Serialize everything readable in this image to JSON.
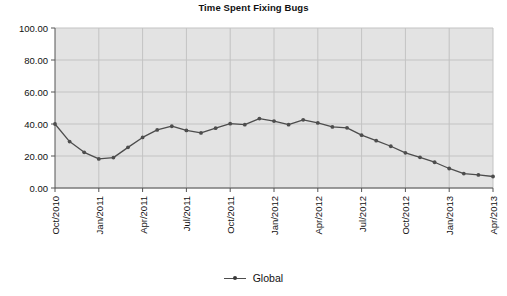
{
  "chart_data": {
    "type": "line",
    "title": "Time Spent Fixing Bugs",
    "xlabel": "",
    "ylabel": "",
    "ylim": [
      0,
      100
    ],
    "ytick_labels": [
      "0.00",
      "20.00",
      "40.00",
      "60.00",
      "80.00",
      "100.00"
    ],
    "ytick_values": [
      0,
      20,
      40,
      60,
      80,
      100
    ],
    "xtick_labels": [
      "Oct/2010",
      "Jan/2011",
      "Apr/2011",
      "Jul/2011",
      "Oct/2011",
      "Jan/2012",
      "Apr/2012",
      "Jul/2012",
      "Oct/2012",
      "Jan/2013",
      "Apr/2013"
    ],
    "xtick_indices": [
      0,
      3,
      6,
      9,
      12,
      15,
      18,
      21,
      24,
      27,
      30
    ],
    "grid": true,
    "legend_position": "bottom",
    "categories": [
      "Oct/2010",
      "Nov/2010",
      "Dec/2010",
      "Jan/2011",
      "Feb/2011",
      "Mar/2011",
      "Apr/2011",
      "May/2011",
      "Jun/2011",
      "Jul/2011",
      "Aug/2011",
      "Sep/2011",
      "Oct/2011",
      "Nov/2011",
      "Dec/2011",
      "Jan/2012",
      "Feb/2012",
      "Mar/2012",
      "Apr/2012",
      "May/2012",
      "Jun/2012",
      "Jul/2012",
      "Aug/2012",
      "Sep/2012",
      "Oct/2012",
      "Nov/2012",
      "Dec/2012",
      "Jan/2013",
      "Feb/2013",
      "Mar/2013",
      "Apr/2013"
    ],
    "series": [
      {
        "name": "Global",
        "color": "#4d4d4d",
        "values": [
          40.0,
          29.0,
          22.3,
          18.2,
          19.0,
          25.4,
          31.6,
          36.3,
          38.6,
          36.0,
          34.4,
          37.4,
          40.2,
          39.6,
          43.4,
          41.8,
          39.6,
          42.6,
          40.7,
          38.2,
          37.6,
          33.0,
          29.6,
          26.1,
          22.0,
          19.2,
          16.1,
          12.2,
          9.0,
          8.2,
          7.2
        ]
      }
    ]
  },
  "legend": {
    "entries": [
      {
        "label": "Global"
      }
    ]
  },
  "colors": {
    "plot_background": "#e3e3e3",
    "grid": "#c3c3c3",
    "axis": "#555555",
    "series": "#4d4d4d",
    "text": "#111111",
    "page_background": "#ffffff"
  }
}
